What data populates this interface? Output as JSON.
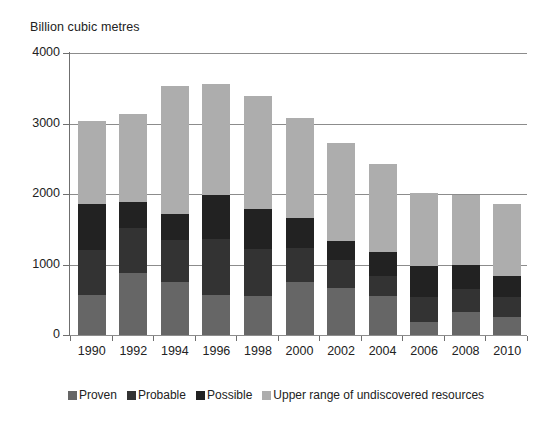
{
  "chart_data": {
    "type": "bar",
    "stacked": true,
    "title": "",
    "ylabel": "Billion cubic metres",
    "xlabel": "",
    "ylim": [
      0,
      4000
    ],
    "yticks": [
      0,
      1000,
      2000,
      3000,
      4000
    ],
    "ytick_labels": [
      "0",
      "1000",
      "2000",
      "3000",
      "4000"
    ],
    "grid": true,
    "grid_axis": "y",
    "legend_position": "bottom",
    "categories": [
      "1990",
      "1992",
      "1994",
      "1996",
      "1998",
      "2000",
      "2002",
      "2004",
      "2006",
      "2008",
      "2010"
    ],
    "series": [
      {
        "name": "Proven",
        "color": "#666666",
        "values": [
          570,
          880,
          750,
          570,
          560,
          750,
          670,
          550,
          190,
          320,
          255
        ]
      },
      {
        "name": "Probable",
        "color": "#333333",
        "values": [
          635,
          640,
          600,
          790,
          660,
          490,
          400,
          290,
          350,
          330,
          285
        ]
      },
      {
        "name": "Possible",
        "color": "#222222",
        "values": [
          655,
          370,
          370,
          620,
          570,
          420,
          270,
          340,
          440,
          340,
          300
        ]
      },
      {
        "name": "Upper range of undiscovered resources",
        "color": "#adadad",
        "values": [
          1180,
          1250,
          1810,
          1580,
          1600,
          1420,
          1380,
          1250,
          1040,
          990,
          1020
        ]
      }
    ],
    "totals": [
      3040,
      3140,
      3530,
      3560,
      3390,
      3080,
      2720,
      2430,
      2020,
      1980,
      1860
    ]
  },
  "legend": {
    "items": [
      {
        "label": "Proven",
        "color": "#666666"
      },
      {
        "label": "Probable",
        "color": "#333333"
      },
      {
        "label": "Possible",
        "color": "#222222"
      },
      {
        "label": "Upper range of undiscovered resources",
        "color": "#adadad"
      }
    ]
  }
}
